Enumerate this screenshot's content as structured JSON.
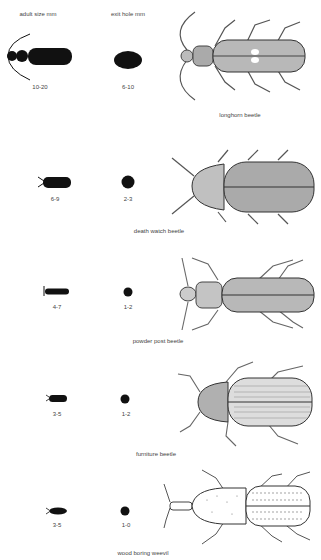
{
  "headers": {
    "adult_size": "adult size mm",
    "exit_hole": "exit hole mm"
  },
  "rows": [
    {
      "name": "longhorn beetle",
      "adult_size": "10-20",
      "exit_hole": "6-10"
    },
    {
      "name": "death watch beetle",
      "adult_size": "6-9",
      "exit_hole": "2-3"
    },
    {
      "name": "powder post  beetle",
      "adult_size": "4-7",
      "exit_hole": "1-2"
    },
    {
      "name": "furniture  beetle",
      "adult_size": "3-5",
      "exit_hole": "1-2"
    },
    {
      "name": "wood boring weevil",
      "adult_size": "3-5",
      "exit_hole": "1-0"
    }
  ],
  "colors": {
    "ink": "#111111",
    "stipple": "#9a9a9a",
    "background": "#ffffff"
  }
}
